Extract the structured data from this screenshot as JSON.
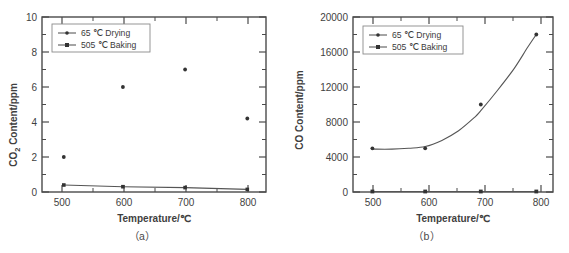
{
  "figure": {
    "background": "#ffffff",
    "ink_color": "#4a4a4a",
    "panels": [
      {
        "caption": "（a）"
      },
      {
        "caption": "（b）"
      }
    ]
  },
  "chart_data": [
    {
      "type": "line",
      "panel_label": "（a）",
      "title": "",
      "xlabel": "Temperature/℃",
      "ylabel": "CO₂ Content/ppm",
      "ylabel_parts": {
        "base": "CO",
        "sub": "2",
        "rest": " Content/ppm"
      },
      "xlim": [
        470,
        830
      ],
      "ylim": [
        0,
        10
      ],
      "xticks": [
        500,
        600,
        700,
        800
      ],
      "xtick_labels": [
        "500",
        "600",
        "700",
        "800"
      ],
      "x_minor_ticks": [
        550,
        650,
        750
      ],
      "yticks": [
        0,
        2,
        4,
        6,
        8,
        10
      ],
      "ytick_labels": [
        "0",
        "2",
        "4",
        "6",
        "8",
        "10"
      ],
      "y_minor_ticks": [
        1,
        3,
        5,
        7,
        9
      ],
      "grid": false,
      "legend_position": "upper-left",
      "series": [
        {
          "name": "65 ℃ Drying",
          "marker": "dot",
          "x": [
            505,
            600,
            700,
            800
          ],
          "values": [
            2.0,
            6.0,
            7.0,
            4.2
          ],
          "fit_curve": "parabolic peak ≈ 6.5 at 675 ℃",
          "fit_points": [
            [
              505,
              2.0
            ],
            [
              530,
              3.1
            ],
            [
              560,
              4.2
            ],
            [
              590,
              5.1
            ],
            [
              620,
              5.8
            ],
            [
              650,
              6.3
            ],
            [
              675,
              6.5
            ],
            [
              700,
              6.45
            ],
            [
              730,
              6.1
            ],
            [
              760,
              5.5
            ],
            [
              785,
              4.8
            ],
            [
              800,
              4.2
            ]
          ]
        },
        {
          "name": "505 ℃ Baking",
          "marker": "square",
          "x": [
            505,
            600,
            700,
            800
          ],
          "values": [
            0.4,
            0.3,
            0.25,
            0.15
          ]
        }
      ]
    },
    {
      "type": "line",
      "panel_label": "（b）",
      "title": "",
      "xlabel": "Temperature/℃",
      "ylabel": "CO Content/ppm",
      "ylabel_parts": {
        "base": "CO Content/ppm",
        "sub": "",
        "rest": ""
      },
      "xlim": [
        470,
        830
      ],
      "ylim": [
        0,
        20000
      ],
      "xticks": [
        500,
        600,
        700,
        800
      ],
      "xtick_labels": [
        "500",
        "600",
        "700",
        "800"
      ],
      "x_minor_ticks": [
        550,
        650,
        750
      ],
      "yticks": [
        0,
        4000,
        8000,
        12000,
        16000,
        20000
      ],
      "ytick_labels": [
        "0",
        "4000",
        "8000",
        "12000",
        "16000",
        "20000"
      ],
      "y_minor_ticks": [
        2000,
        6000,
        10000,
        14000,
        18000
      ],
      "grid": false,
      "legend_position": "upper-left",
      "series": [
        {
          "name": "65 ℃ Drying",
          "marker": "dot",
          "x": [
            505,
            600,
            700,
            800
          ],
          "values": [
            5000,
            5000,
            10000,
            18000
          ],
          "fit_curve": "exponential rise",
          "fit_points": [
            [
              505,
              4900
            ],
            [
              540,
              4900
            ],
            [
              570,
              5000
            ],
            [
              600,
              5200
            ],
            [
              630,
              5900
            ],
            [
              660,
              7000
            ],
            [
              690,
              8600
            ],
            [
              700,
              9300
            ],
            [
              730,
              11600
            ],
            [
              760,
              14100
            ],
            [
              785,
              16600
            ],
            [
              800,
              18000
            ]
          ]
        },
        {
          "name": "505 ℃ Baking",
          "marker": "square",
          "x": [
            505,
            600,
            700,
            800
          ],
          "values": [
            60,
            60,
            60,
            60
          ]
        }
      ]
    }
  ]
}
